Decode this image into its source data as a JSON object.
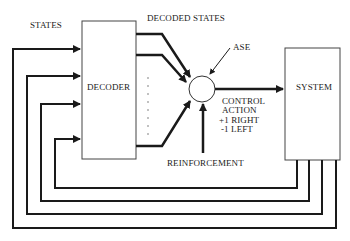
{
  "labels": {
    "states": "STATES",
    "decoded_states": "DECODED STATES",
    "decoder": "DECODER",
    "ase": "ASE",
    "system": "SYSTEM",
    "control_action_line1": "CONTROL",
    "control_action_line2": "ACTION",
    "right": "+1 RIGHT",
    "left": "-1 LEFT",
    "reinforcement": "REINFORCEMENT"
  },
  "colors": {
    "line": "#1a1a1a",
    "box_border": "#444444",
    "background": "#ffffff"
  }
}
